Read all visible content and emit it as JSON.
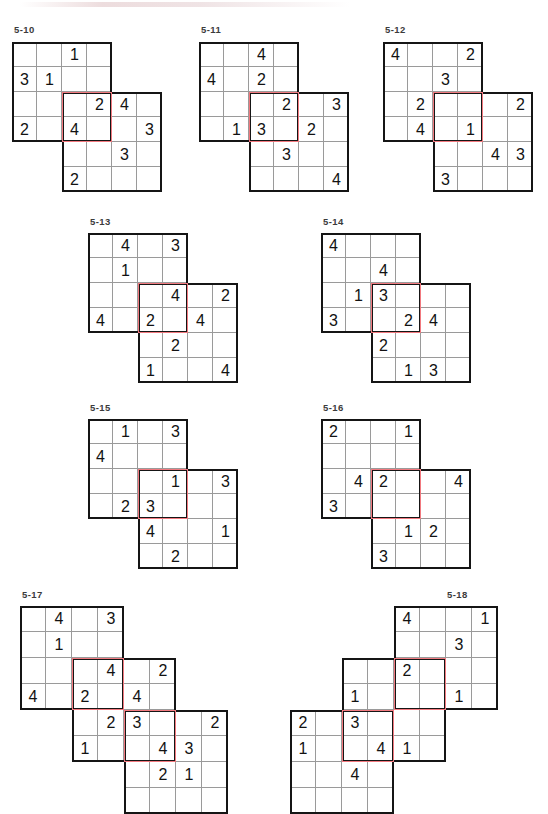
{
  "sheet": {
    "kind": "puzzle-worksheet",
    "page_width": 548,
    "page_height": 786,
    "cell_size_small": 25,
    "cell_size_large": 27,
    "colors": {
      "grid_line": "#9a9a9a",
      "block_border": "#151515",
      "overlap_border": "#f2797f",
      "digit": "#121212",
      "label": "#3b3b3b",
      "background": "#ffffff"
    }
  },
  "puzzles": [
    {
      "id": "5-10",
      "label": "5-10",
      "label_x": 14,
      "label_y": 24,
      "origin_x": 12,
      "origin_y": 42,
      "cell": 25,
      "cols": 6,
      "rows": 6,
      "blocks": [
        {
          "name": "top-left-block",
          "col": 0,
          "row": 0,
          "w": 4,
          "h": 4
        },
        {
          "name": "center-block",
          "col": 2,
          "row": 2,
          "w": 4,
          "h": 4
        }
      ],
      "overlaps": [
        {
          "name": "overlap-center",
          "col": 2,
          "row": 2,
          "w": 2,
          "h": 2
        }
      ],
      "givens": [
        {
          "col": 2,
          "row": 0,
          "value": "1"
        },
        {
          "col": 0,
          "row": 1,
          "value": "3"
        },
        {
          "col": 1,
          "row": 1,
          "value": "1"
        },
        {
          "col": 3,
          "row": 2,
          "value": "2"
        },
        {
          "col": 4,
          "row": 2,
          "value": "4"
        },
        {
          "col": 0,
          "row": 3,
          "value": "2"
        },
        {
          "col": 2,
          "row": 3,
          "value": "4"
        },
        {
          "col": 5,
          "row": 3,
          "value": "3"
        },
        {
          "col": 4,
          "row": 4,
          "value": "3"
        },
        {
          "col": 2,
          "row": 5,
          "value": "2"
        }
      ]
    },
    {
      "id": "5-11",
      "label": "5-11",
      "label_x": 201,
      "label_y": 24,
      "origin_x": 199,
      "origin_y": 42,
      "cell": 25,
      "cols": 6,
      "rows": 6,
      "blocks": [
        {
          "name": "top-left-block",
          "col": 0,
          "row": 0,
          "w": 4,
          "h": 4
        },
        {
          "name": "center-block",
          "col": 2,
          "row": 2,
          "w": 4,
          "h": 4
        }
      ],
      "overlaps": [
        {
          "name": "overlap-center",
          "col": 2,
          "row": 2,
          "w": 2,
          "h": 2
        }
      ],
      "givens": [
        {
          "col": 2,
          "row": 0,
          "value": "4"
        },
        {
          "col": 0,
          "row": 1,
          "value": "4"
        },
        {
          "col": 2,
          "row": 1,
          "value": "2"
        },
        {
          "col": 3,
          "row": 2,
          "value": "2"
        },
        {
          "col": 5,
          "row": 2,
          "value": "3"
        },
        {
          "col": 1,
          "row": 3,
          "value": "1"
        },
        {
          "col": 2,
          "row": 3,
          "value": "3"
        },
        {
          "col": 4,
          "row": 3,
          "value": "2"
        },
        {
          "col": 3,
          "row": 4,
          "value": "3"
        },
        {
          "col": 5,
          "row": 5,
          "value": "4"
        }
      ]
    },
    {
      "id": "5-12",
      "label": "5-12",
      "label_x": 385,
      "label_y": 24,
      "origin_x": 383,
      "origin_y": 42,
      "cell": 25,
      "cols": 6,
      "rows": 6,
      "blocks": [
        {
          "name": "top-left-block",
          "col": 0,
          "row": 0,
          "w": 4,
          "h": 4
        },
        {
          "name": "center-block",
          "col": 2,
          "row": 2,
          "w": 4,
          "h": 4
        }
      ],
      "overlaps": [
        {
          "name": "overlap-center",
          "col": 2,
          "row": 2,
          "w": 2,
          "h": 2
        }
      ],
      "givens": [
        {
          "col": 0,
          "row": 0,
          "value": "4"
        },
        {
          "col": 3,
          "row": 0,
          "value": "2"
        },
        {
          "col": 2,
          "row": 1,
          "value": "3"
        },
        {
          "col": 1,
          "row": 2,
          "value": "2"
        },
        {
          "col": 5,
          "row": 2,
          "value": "2"
        },
        {
          "col": 1,
          "row": 3,
          "value": "4"
        },
        {
          "col": 3,
          "row": 3,
          "value": "1"
        },
        {
          "col": 4,
          "row": 4,
          "value": "4"
        },
        {
          "col": 5,
          "row": 4,
          "value": "3"
        },
        {
          "col": 2,
          "row": 5,
          "value": "3"
        }
      ]
    },
    {
      "id": "5-13",
      "label": "5-13",
      "label_x": 90,
      "label_y": 216,
      "origin_x": 88,
      "origin_y": 233,
      "cell": 25,
      "cols": 6,
      "rows": 6,
      "blocks": [
        {
          "name": "top-left-block",
          "col": 0,
          "row": 0,
          "w": 4,
          "h": 4
        },
        {
          "name": "center-block",
          "col": 2,
          "row": 2,
          "w": 4,
          "h": 4
        }
      ],
      "overlaps": [
        {
          "name": "overlap-center",
          "col": 2,
          "row": 2,
          "w": 2,
          "h": 2
        }
      ],
      "givens": [
        {
          "col": 1,
          "row": 0,
          "value": "4"
        },
        {
          "col": 3,
          "row": 0,
          "value": "3"
        },
        {
          "col": 1,
          "row": 1,
          "value": "1"
        },
        {
          "col": 3,
          "row": 2,
          "value": "4"
        },
        {
          "col": 5,
          "row": 2,
          "value": "2"
        },
        {
          "col": 0,
          "row": 3,
          "value": "4"
        },
        {
          "col": 2,
          "row": 3,
          "value": "2"
        },
        {
          "col": 4,
          "row": 3,
          "value": "4"
        },
        {
          "col": 3,
          "row": 4,
          "value": "2"
        },
        {
          "col": 2,
          "row": 5,
          "value": "1"
        },
        {
          "col": 5,
          "row": 5,
          "value": "4"
        }
      ]
    },
    {
      "id": "5-14",
      "label": "5-14",
      "label_x": 323,
      "label_y": 216,
      "origin_x": 321,
      "origin_y": 233,
      "cell": 25,
      "cols": 6,
      "rows": 6,
      "blocks": [
        {
          "name": "top-left-block",
          "col": 0,
          "row": 0,
          "w": 4,
          "h": 4
        },
        {
          "name": "center-block",
          "col": 2,
          "row": 2,
          "w": 4,
          "h": 4
        }
      ],
      "overlaps": [
        {
          "name": "overlap-center",
          "col": 2,
          "row": 2,
          "w": 2,
          "h": 2
        }
      ],
      "givens": [
        {
          "col": 0,
          "row": 0,
          "value": "4"
        },
        {
          "col": 2,
          "row": 1,
          "value": "4"
        },
        {
          "col": 1,
          "row": 2,
          "value": "1"
        },
        {
          "col": 2,
          "row": 2,
          "value": "3"
        },
        {
          "col": 0,
          "row": 3,
          "value": "3"
        },
        {
          "col": 3,
          "row": 3,
          "value": "2"
        },
        {
          "col": 4,
          "row": 3,
          "value": "4"
        },
        {
          "col": 2,
          "row": 4,
          "value": "2"
        },
        {
          "col": 3,
          "row": 5,
          "value": "1"
        },
        {
          "col": 4,
          "row": 5,
          "value": "3"
        }
      ]
    },
    {
      "id": "5-15",
      "label": "5-15",
      "label_x": 90,
      "label_y": 402,
      "origin_x": 88,
      "origin_y": 419,
      "cell": 25,
      "cols": 6,
      "rows": 6,
      "blocks": [
        {
          "name": "top-left-block",
          "col": 0,
          "row": 0,
          "w": 4,
          "h": 4
        },
        {
          "name": "center-block",
          "col": 2,
          "row": 2,
          "w": 4,
          "h": 4
        }
      ],
      "overlaps": [
        {
          "name": "overlap-center",
          "col": 2,
          "row": 2,
          "w": 2,
          "h": 2
        }
      ],
      "givens": [
        {
          "col": 1,
          "row": 0,
          "value": "1"
        },
        {
          "col": 3,
          "row": 0,
          "value": "3"
        },
        {
          "col": 0,
          "row": 1,
          "value": "4"
        },
        {
          "col": 3,
          "row": 2,
          "value": "1"
        },
        {
          "col": 5,
          "row": 2,
          "value": "3"
        },
        {
          "col": 1,
          "row": 3,
          "value": "2"
        },
        {
          "col": 2,
          "row": 3,
          "value": "3"
        },
        {
          "col": 2,
          "row": 4,
          "value": "4"
        },
        {
          "col": 5,
          "row": 4,
          "value": "1"
        },
        {
          "col": 3,
          "row": 5,
          "value": "2"
        }
      ]
    },
    {
      "id": "5-16",
      "label": "5-16",
      "label_x": 323,
      "label_y": 402,
      "origin_x": 321,
      "origin_y": 419,
      "cell": 25,
      "cols": 6,
      "rows": 6,
      "blocks": [
        {
          "name": "top-left-block",
          "col": 0,
          "row": 0,
          "w": 4,
          "h": 4
        },
        {
          "name": "center-block",
          "col": 2,
          "row": 2,
          "w": 4,
          "h": 4
        }
      ],
      "overlaps": [
        {
          "name": "overlap-center",
          "col": 2,
          "row": 2,
          "w": 2,
          "h": 2
        }
      ],
      "givens": [
        {
          "col": 0,
          "row": 0,
          "value": "2"
        },
        {
          "col": 3,
          "row": 0,
          "value": "1"
        },
        {
          "col": 1,
          "row": 2,
          "value": "4"
        },
        {
          "col": 2,
          "row": 2,
          "value": "2"
        },
        {
          "col": 5,
          "row": 2,
          "value": "4"
        },
        {
          "col": 0,
          "row": 3,
          "value": "3"
        },
        {
          "col": 3,
          "row": 4,
          "value": "1"
        },
        {
          "col": 4,
          "row": 4,
          "value": "2"
        },
        {
          "col": 2,
          "row": 5,
          "value": "3"
        }
      ]
    },
    {
      "id": "5-17",
      "label": "5-17",
      "label_x": 22,
      "label_y": 589,
      "origin_x": 20,
      "origin_y": 606,
      "cell": 26,
      "cols": 8,
      "rows": 8,
      "blocks": [
        {
          "name": "top-left-block",
          "col": 0,
          "row": 0,
          "w": 4,
          "h": 4
        },
        {
          "name": "middle-block",
          "col": 2,
          "row": 2,
          "w": 4,
          "h": 4
        },
        {
          "name": "bottom-right-block",
          "col": 4,
          "row": 4,
          "w": 4,
          "h": 4
        }
      ],
      "overlaps": [
        {
          "name": "overlap-upper",
          "col": 2,
          "row": 2,
          "w": 2,
          "h": 2
        },
        {
          "name": "overlap-lower",
          "col": 4,
          "row": 4,
          "w": 2,
          "h": 2
        }
      ],
      "givens": [
        {
          "col": 1,
          "row": 0,
          "value": "4"
        },
        {
          "col": 3,
          "row": 0,
          "value": "3"
        },
        {
          "col": 1,
          "row": 1,
          "value": "1"
        },
        {
          "col": 3,
          "row": 2,
          "value": "4"
        },
        {
          "col": 5,
          "row": 2,
          "value": "2"
        },
        {
          "col": 0,
          "row": 3,
          "value": "4"
        },
        {
          "col": 2,
          "row": 3,
          "value": "2"
        },
        {
          "col": 4,
          "row": 3,
          "value": "4"
        },
        {
          "col": 3,
          "row": 4,
          "value": "2"
        },
        {
          "col": 4,
          "row": 4,
          "value": "3"
        },
        {
          "col": 7,
          "row": 4,
          "value": "2"
        },
        {
          "col": 2,
          "row": 5,
          "value": "1"
        },
        {
          "col": 5,
          "row": 5,
          "value": "4"
        },
        {
          "col": 6,
          "row": 5,
          "value": "3"
        },
        {
          "col": 5,
          "row": 6,
          "value": "2"
        },
        {
          "col": 6,
          "row": 6,
          "value": "1"
        }
      ]
    },
    {
      "id": "5-18",
      "label": "5-18",
      "label_x": 447,
      "label_y": 589,
      "origin_x": 290,
      "origin_y": 606,
      "cell": 26,
      "cols": 9,
      "rows": 8,
      "blocks": [
        {
          "name": "top-right-block",
          "col": 4,
          "row": 0,
          "w": 4,
          "h": 4
        },
        {
          "name": "middle-block",
          "col": 2,
          "row": 2,
          "w": 4,
          "h": 4
        },
        {
          "name": "bottom-left-block",
          "col": 0,
          "row": 4,
          "w": 4,
          "h": 4
        }
      ],
      "overlaps": [
        {
          "name": "overlap-upper",
          "col": 4,
          "row": 2,
          "w": 2,
          "h": 2
        },
        {
          "name": "overlap-lower",
          "col": 2,
          "row": 4,
          "w": 2,
          "h": 2
        }
      ],
      "givens": [
        {
          "col": 4,
          "row": 0,
          "value": "4"
        },
        {
          "col": 7,
          "row": 0,
          "value": "1"
        },
        {
          "col": 6,
          "row": 1,
          "value": "3"
        },
        {
          "col": 4,
          "row": 2,
          "value": "2"
        },
        {
          "col": 2,
          "row": 3,
          "value": "1"
        },
        {
          "col": 6,
          "row": 3,
          "value": "1"
        },
        {
          "col": 0,
          "row": 4,
          "value": "2"
        },
        {
          "col": 2,
          "row": 4,
          "value": "3"
        },
        {
          "col": 0,
          "row": 5,
          "value": "1"
        },
        {
          "col": 3,
          "row": 5,
          "value": "4"
        },
        {
          "col": 4,
          "row": 5,
          "value": "1"
        },
        {
          "col": 2,
          "row": 6,
          "value": "4"
        }
      ]
    }
  ]
}
